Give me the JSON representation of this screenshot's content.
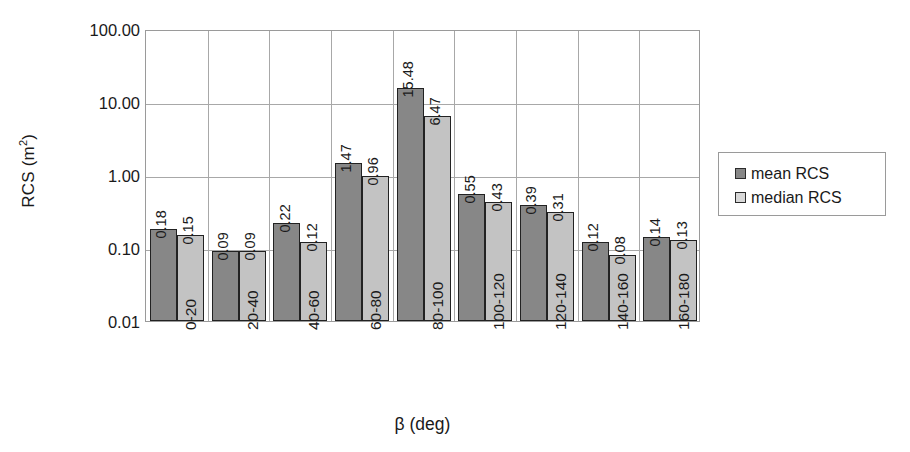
{
  "chart_data": {
    "type": "bar",
    "title": "",
    "xlabel": "β (deg)",
    "ylabel": "RCS (m2)",
    "ylabel_base": "RCS (m",
    "ylabel_sup": "2",
    "ylabel_tail": ")",
    "yscale": "log",
    "ylim": [
      0.01,
      100.0
    ],
    "ytick_labels": [
      "100.00",
      "10.00",
      "1.00",
      "0.10",
      "0.01"
    ],
    "ytick_values": [
      100.0,
      10.0,
      1.0,
      0.1,
      0.01
    ],
    "grid": true,
    "legend_position": "right",
    "categories": [
      "0-20",
      "20-40",
      "40-60",
      "60-80",
      "80-100",
      "100-120",
      "120-140",
      "140-160",
      "160-180"
    ],
    "series": [
      {
        "name": "mean RCS",
        "color": "#878787",
        "values": [
          0.18,
          0.09,
          0.22,
          1.47,
          15.48,
          0.55,
          0.39,
          0.12,
          0.14
        ],
        "labels": [
          "0.18",
          "0.09",
          "0.22",
          "1.47",
          "15.48",
          "0.55",
          "0.39",
          "0.12",
          "0.14"
        ]
      },
      {
        "name": "median RCS",
        "color": "#c3c3c3",
        "values": [
          0.15,
          0.09,
          0.12,
          0.96,
          6.47,
          0.43,
          0.31,
          0.08,
          0.13
        ],
        "labels": [
          "0.15",
          "0.09",
          "0.12",
          "0.96",
          "6.47",
          "0.43",
          "0.31",
          "0.08",
          "0.13"
        ]
      }
    ]
  },
  "legend": {
    "items": [
      {
        "label": "mean RCS",
        "swatch": "mean"
      },
      {
        "label": "median RCS",
        "swatch": "median"
      }
    ]
  }
}
